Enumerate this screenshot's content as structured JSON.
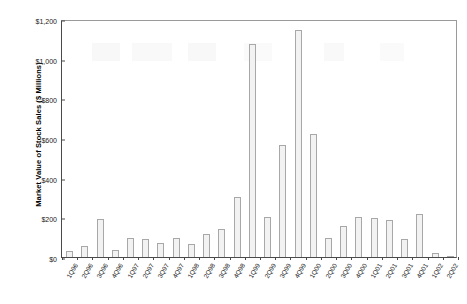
{
  "chart_data": {
    "type": "bar",
    "title": "",
    "xlabel": "",
    "ylabel": "Market Value of Stock Sales ($ Millions)",
    "ylim": [
      0,
      1200
    ],
    "ytick_labels": [
      "$0",
      "$200",
      "$400",
      "$600",
      "$800",
      "$1,000",
      "$1,200"
    ],
    "ytick_values": [
      0,
      200,
      400,
      600,
      800,
      1000,
      1200
    ],
    "grid": false,
    "legend": null,
    "categories": [
      "1Q96",
      "2Q96",
      "3Q96",
      "4Q96",
      "1Q97",
      "2Q97",
      "3Q97",
      "4Q97",
      "1Q98",
      "2Q98",
      "3Q98",
      "4Q98",
      "1Q99",
      "2Q99",
      "3Q99",
      "4Q99",
      "1Q00",
      "2Q00",
      "3Q00",
      "4Q00",
      "1Q01",
      "2Q01",
      "3Q01",
      "4Q01",
      "1Q02",
      "2Q02"
    ],
    "values": [
      30,
      55,
      190,
      35,
      95,
      90,
      70,
      95,
      65,
      115,
      140,
      305,
      1075,
      200,
      565,
      1145,
      620,
      95,
      155,
      200,
      195,
      185,
      90,
      215,
      20,
      5
    ],
    "bar_fill_color": "#f2f2f2",
    "bar_edge_color": "#a8a8a8",
    "axis_color": "#4a4a4a",
    "background_color": "#ffffff"
  }
}
